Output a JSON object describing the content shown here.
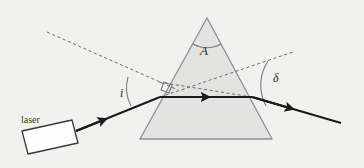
{
  "figure": {
    "background_color": "#f1f1ef",
    "width": 364,
    "height": 168
  },
  "labels": {
    "laser": "laser",
    "apex_angle": "A",
    "incidence_angle": "i",
    "deviation_angle": "δ"
  },
  "colors": {
    "background": "#f1f1ef",
    "prism_fill": "#e3e3e1",
    "prism_stroke": "#8f8f93",
    "ray_stroke": "#1b1b1b",
    "dashed_stroke": "#6d6d70",
    "arc_stroke": "#7a7a7e",
    "laser_body_fill": "#fdfdfd",
    "laser_body_stroke": "#3a3a3a",
    "text": "#2c2c2c"
  },
  "geometry": {
    "prism": {
      "apex": [
        207,
        18
      ],
      "base_left": [
        140,
        139
      ],
      "base_right": [
        272,
        139
      ]
    },
    "entry_point": [
      160,
      97
    ],
    "exit_point": [
      252,
      97
    ],
    "incident_ray": {
      "from": [
        76,
        131
      ],
      "to": [
        160,
        97
      ]
    },
    "internal_ray": {
      "from": [
        160,
        97
      ],
      "to": [
        252,
        97
      ]
    },
    "exit_ray": {
      "from": [
        252,
        97
      ],
      "to": [
        341,
        123
      ]
    },
    "normal_dashed": {
      "from": [
        47,
        32
      ],
      "to": [
        178,
        90
      ]
    },
    "incident_extension_dashed": {
      "from": [
        160,
        97
      ],
      "to": [
        293,
        52
      ]
    },
    "exit_back_extension_dashed": {
      "from": [
        252,
        97
      ],
      "to": [
        160,
        82
      ]
    }
  },
  "elements": {
    "prism_name": "triangular-prism",
    "laser_name": "laser-source-box",
    "arc_apex_name": "apex-angle-arc",
    "arc_incidence_name": "incidence-angle-arc",
    "arc_deviation_name": "deviation-angle-arc",
    "right_angle_marker_name": "right-angle-marker"
  }
}
